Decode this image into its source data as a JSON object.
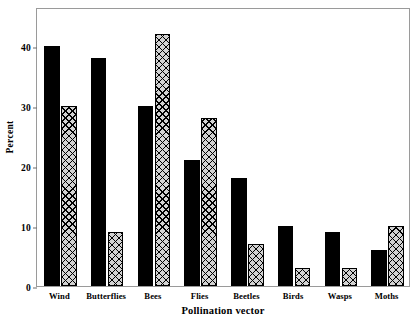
{
  "chart_data": {
    "type": "bar",
    "title": "",
    "xlabel": "Pollination vector",
    "ylabel": "Percent",
    "categories": [
      "Wind",
      "Butterflies",
      "Bees",
      "Flies",
      "Beetles",
      "Birds",
      "Wasps",
      "Moths"
    ],
    "series": [
      {
        "name": "series-1-solid-black",
        "fill": "solid-black",
        "color": "#000000",
        "values": [
          40,
          38,
          30,
          21,
          18,
          10,
          9,
          6
        ]
      },
      {
        "name": "series-2-crosshatch",
        "fill": "crosshatch",
        "color": "#d2d2d2",
        "values": [
          30,
          9,
          42,
          28,
          7,
          3,
          3,
          10
        ]
      }
    ],
    "ylim": [
      0,
      46.5
    ],
    "yticks": [
      0,
      10,
      20,
      30,
      40
    ],
    "ytick_labels": [
      "0",
      "10",
      "20",
      "30",
      "40"
    ],
    "grid": false,
    "legend": "none",
    "frame_color": "#9a9a9a"
  }
}
